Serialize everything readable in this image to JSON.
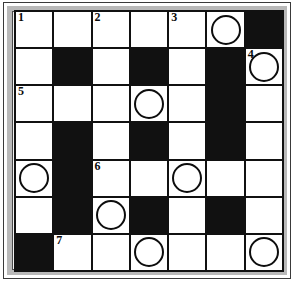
{
  "puzzle": {
    "type": "crossword-grid",
    "rows": 7,
    "cols": 7,
    "colors": {
      "block": "#111111",
      "open": "#ffffff",
      "grid_line": "#111111",
      "frame_band": "#c9c9c9",
      "text": "#0a0a0a"
    },
    "clue_numbers_visible": [
      "1",
      "2",
      "3",
      "4",
      "5",
      "6",
      "7"
    ],
    "circled_cell_count": 8,
    "block_cell_count": 14,
    "cells": [
      {
        "row": 0,
        "col": 0,
        "block": false,
        "number": "1",
        "circle": false,
        "letter": ""
      },
      {
        "row": 0,
        "col": 1,
        "block": false,
        "number": "",
        "circle": false,
        "letter": ""
      },
      {
        "row": 0,
        "col": 2,
        "block": false,
        "number": "2",
        "circle": false,
        "letter": ""
      },
      {
        "row": 0,
        "col": 3,
        "block": false,
        "number": "",
        "circle": false,
        "letter": ""
      },
      {
        "row": 0,
        "col": 4,
        "block": false,
        "number": "3",
        "circle": false,
        "letter": ""
      },
      {
        "row": 0,
        "col": 5,
        "block": false,
        "number": "",
        "circle": true,
        "letter": ""
      },
      {
        "row": 0,
        "col": 6,
        "block": true,
        "number": "",
        "circle": false,
        "letter": ""
      },
      {
        "row": 1,
        "col": 0,
        "block": false,
        "number": "",
        "circle": false,
        "letter": ""
      },
      {
        "row": 1,
        "col": 1,
        "block": true,
        "number": "",
        "circle": false,
        "letter": ""
      },
      {
        "row": 1,
        "col": 2,
        "block": false,
        "number": "",
        "circle": false,
        "letter": ""
      },
      {
        "row": 1,
        "col": 3,
        "block": true,
        "number": "",
        "circle": false,
        "letter": ""
      },
      {
        "row": 1,
        "col": 4,
        "block": false,
        "number": "",
        "circle": false,
        "letter": ""
      },
      {
        "row": 1,
        "col": 5,
        "block": true,
        "number": "",
        "circle": false,
        "letter": ""
      },
      {
        "row": 1,
        "col": 6,
        "block": false,
        "number": "4",
        "circle": true,
        "letter": ""
      },
      {
        "row": 2,
        "col": 0,
        "block": false,
        "number": "5",
        "circle": false,
        "letter": ""
      },
      {
        "row": 2,
        "col": 1,
        "block": false,
        "number": "",
        "circle": false,
        "letter": ""
      },
      {
        "row": 2,
        "col": 2,
        "block": false,
        "number": "",
        "circle": false,
        "letter": ""
      },
      {
        "row": 2,
        "col": 3,
        "block": false,
        "number": "",
        "circle": true,
        "letter": ""
      },
      {
        "row": 2,
        "col": 4,
        "block": false,
        "number": "",
        "circle": false,
        "letter": ""
      },
      {
        "row": 2,
        "col": 5,
        "block": true,
        "number": "",
        "circle": false,
        "letter": ""
      },
      {
        "row": 2,
        "col": 6,
        "block": false,
        "number": "",
        "circle": false,
        "letter": ""
      },
      {
        "row": 3,
        "col": 0,
        "block": false,
        "number": "",
        "circle": false,
        "letter": ""
      },
      {
        "row": 3,
        "col": 1,
        "block": true,
        "number": "",
        "circle": false,
        "letter": ""
      },
      {
        "row": 3,
        "col": 2,
        "block": false,
        "number": "",
        "circle": false,
        "letter": ""
      },
      {
        "row": 3,
        "col": 3,
        "block": true,
        "number": "",
        "circle": false,
        "letter": ""
      },
      {
        "row": 3,
        "col": 4,
        "block": false,
        "number": "",
        "circle": false,
        "letter": ""
      },
      {
        "row": 3,
        "col": 5,
        "block": true,
        "number": "",
        "circle": false,
        "letter": ""
      },
      {
        "row": 3,
        "col": 6,
        "block": false,
        "number": "",
        "circle": false,
        "letter": ""
      },
      {
        "row": 4,
        "col": 0,
        "block": false,
        "number": "",
        "circle": true,
        "letter": ""
      },
      {
        "row": 4,
        "col": 1,
        "block": true,
        "number": "",
        "circle": false,
        "letter": ""
      },
      {
        "row": 4,
        "col": 2,
        "block": false,
        "number": "6",
        "circle": false,
        "letter": ""
      },
      {
        "row": 4,
        "col": 3,
        "block": false,
        "number": "",
        "circle": false,
        "letter": ""
      },
      {
        "row": 4,
        "col": 4,
        "block": false,
        "number": "",
        "circle": true,
        "letter": ""
      },
      {
        "row": 4,
        "col": 5,
        "block": false,
        "number": "",
        "circle": false,
        "letter": ""
      },
      {
        "row": 4,
        "col": 6,
        "block": false,
        "number": "",
        "circle": false,
        "letter": ""
      },
      {
        "row": 5,
        "col": 0,
        "block": false,
        "number": "",
        "circle": false,
        "letter": ""
      },
      {
        "row": 5,
        "col": 1,
        "block": true,
        "number": "",
        "circle": false,
        "letter": ""
      },
      {
        "row": 5,
        "col": 2,
        "block": false,
        "number": "",
        "circle": true,
        "letter": ""
      },
      {
        "row": 5,
        "col": 3,
        "block": true,
        "number": "",
        "circle": false,
        "letter": ""
      },
      {
        "row": 5,
        "col": 4,
        "block": false,
        "number": "",
        "circle": false,
        "letter": ""
      },
      {
        "row": 5,
        "col": 5,
        "block": true,
        "number": "",
        "circle": false,
        "letter": ""
      },
      {
        "row": 5,
        "col": 6,
        "block": false,
        "number": "",
        "circle": false,
        "letter": ""
      },
      {
        "row": 6,
        "col": 0,
        "block": true,
        "number": "",
        "circle": false,
        "letter": ""
      },
      {
        "row": 6,
        "col": 1,
        "block": false,
        "number": "7",
        "circle": false,
        "letter": ""
      },
      {
        "row": 6,
        "col": 2,
        "block": false,
        "number": "",
        "circle": false,
        "letter": ""
      },
      {
        "row": 6,
        "col": 3,
        "block": false,
        "number": "",
        "circle": true,
        "letter": ""
      },
      {
        "row": 6,
        "col": 4,
        "block": false,
        "number": "",
        "circle": false,
        "letter": ""
      },
      {
        "row": 6,
        "col": 5,
        "block": false,
        "number": "",
        "circle": false,
        "letter": ""
      },
      {
        "row": 6,
        "col": 6,
        "block": false,
        "number": "",
        "circle": true,
        "letter": ""
      }
    ]
  }
}
